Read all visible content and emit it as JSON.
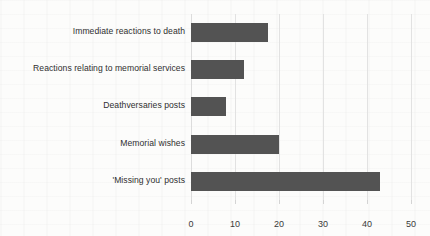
{
  "chart_data": {
    "type": "bar",
    "orientation": "horizontal",
    "title": "",
    "xlabel": "",
    "ylabel": "",
    "categories": [
      "Immediate reactions to death",
      "Reactions relating to memorial services",
      "Deathversaries posts",
      "Memorial wishes",
      "'Missing you' posts"
    ],
    "values": [
      17.5,
      12,
      8,
      20,
      43
    ],
    "xlim": [
      0,
      50
    ],
    "xticks": [
      0,
      10,
      20,
      30,
      40,
      50
    ],
    "xtick_labels": [
      "0",
      "10",
      "20",
      "30",
      "40",
      "50"
    ],
    "grid": "vertical",
    "legend": "none",
    "bar_color": "#535353",
    "gridline_color": "#e2e2e2",
    "background_color": "#fcfcfb",
    "text_color": "#2f2f2f"
  }
}
